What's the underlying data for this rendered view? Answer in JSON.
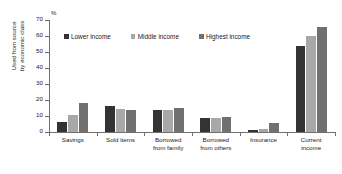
{
  "chart_data": {
    "type": "bar",
    "title": "",
    "xlabel": "",
    "ylabel": "Used from source by economic class",
    "ylabel_lines": [
      "Used from source",
      "by economic class"
    ],
    "unit_label": "%",
    "ylim": [
      0,
      70
    ],
    "ytick_labels": [
      "0",
      "10",
      "20",
      "30",
      "40",
      "50",
      "60",
      "70"
    ],
    "ytick_values": [
      0,
      10,
      20,
      30,
      40,
      50,
      60,
      70
    ],
    "grid": false,
    "legend_position": "top-left-inside",
    "categories": [
      "Savings",
      "Sold items",
      "Borrowed from family",
      "Borrowed from others",
      "Insurance",
      "Current income"
    ],
    "category_label_lines": [
      [
        "Savings"
      ],
      [
        "Sold items"
      ],
      [
        "Borrowed",
        "from family"
      ],
      [
        "Borrowed",
        "from others"
      ],
      [
        "Insurance"
      ],
      [
        "Current",
        "income"
      ]
    ],
    "series": [
      {
        "name": "Lower income",
        "color": "#333333",
        "values": [
          6,
          16,
          14,
          9,
          1,
          54
        ]
      },
      {
        "name": "Middle income",
        "color": "#a8a8a8",
        "values": [
          10.5,
          14.3,
          13.7,
          8.8,
          2,
          60
        ]
      },
      {
        "name": "Highest income",
        "color": "#707070",
        "values": [
          18,
          13.7,
          15.3,
          9.4,
          5.5,
          65.5
        ]
      }
    ]
  },
  "colors": {
    "axis": "#6e6e6e",
    "text": "#1a1a1a",
    "background": "#ffffff"
  }
}
